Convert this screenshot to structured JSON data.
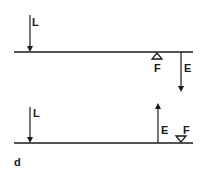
{
  "figure": {
    "panel_label": "d",
    "diagrams": [
      {
        "name": "lever-top",
        "labels": {
          "load": "L",
          "fulcrum": "F",
          "effort": "E"
        },
        "load_direction": "down",
        "effort_direction": "down",
        "fulcrum_orientation": "below-beam"
      },
      {
        "name": "lever-bottom",
        "labels": {
          "load": "L",
          "fulcrum": "F",
          "effort": "E"
        },
        "load_direction": "down",
        "effort_direction": "up",
        "fulcrum_orientation": "above-beam"
      }
    ]
  },
  "colors": {
    "ink": "#1a1a1a",
    "background": "#ffffff"
  }
}
